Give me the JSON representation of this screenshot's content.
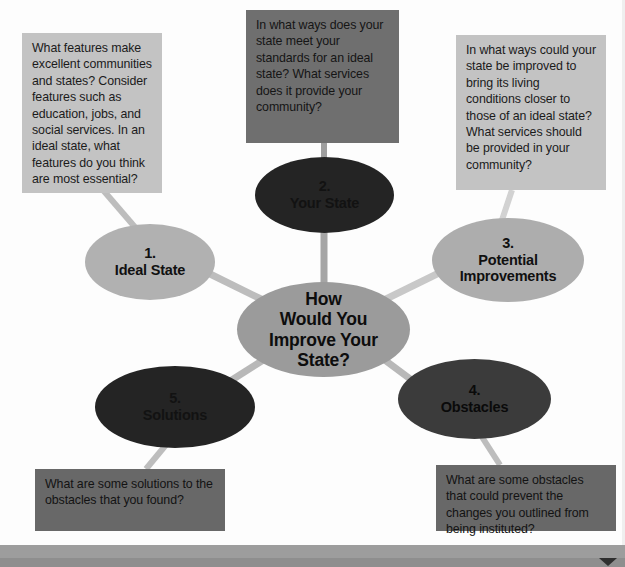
{
  "diagram": {
    "title": "How Would You Improve Your State?",
    "type": "concept-map",
    "center_node": {
      "id": "center",
      "label": "How\nWould You\nImprove Your\nState?",
      "color": "#9b9b9b"
    },
    "nodes": [
      {
        "id": "node-1",
        "number": "1.",
        "name": "Ideal State",
        "label": "1.\nIdeal State",
        "color": "#b1b1b1"
      },
      {
        "id": "node-2",
        "number": "2.",
        "name": "Your State",
        "label": "2.\nYour State",
        "color": "#242424"
      },
      {
        "id": "node-3",
        "number": "3.",
        "name": "Potential Improvements",
        "label": "3.\nPotential\nImprovements",
        "color": "#adadad"
      },
      {
        "id": "node-4",
        "number": "4.",
        "name": "Obstacles",
        "label": "4.\nObstacles",
        "color": "#3b3b3b"
      },
      {
        "id": "node-5",
        "number": "5.",
        "name": "Solutions",
        "label": "5.\nSolutions",
        "color": "#2b2b2b"
      }
    ],
    "notes": [
      {
        "id": "note-1",
        "attached_to": "node-1",
        "text": "What features make excellent communities and states? Consider features such as education, jobs, and social services. In an ideal state, what features do you think are most essential?",
        "color": "#c3c3c3"
      },
      {
        "id": "note-2",
        "attached_to": "node-2",
        "text": "In what ways does your state meet your standards for an ideal state? What services does it provide your community?",
        "color": "#6f6f6f"
      },
      {
        "id": "note-3",
        "attached_to": "node-3",
        "text": "In what ways could your state be improved to bring its living conditions closer to those of an ideal state? What services should be provided in your community?",
        "color": "#c3c3c3"
      },
      {
        "id": "note-4",
        "attached_to": "node-4",
        "text": "What are some obstacles that could prevent the changes you outlined from being instituted?",
        "color": "#686868"
      },
      {
        "id": "note-5",
        "attached_to": "node-5",
        "text": "What are some solutions to the obstacles that you found?",
        "color": "#686868"
      }
    ],
    "connector_color": "#b5b5b5"
  },
  "footer": {
    "bar_color": "#9d9d9d",
    "arrow_icon": "next-arrow-icon"
  }
}
